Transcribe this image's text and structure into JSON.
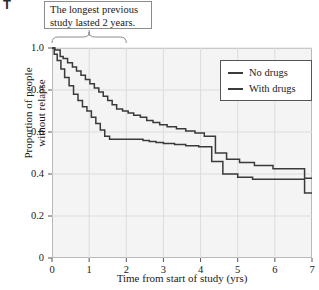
{
  "figure": {
    "corner_mark": "T",
    "annotation": {
      "name": "callout-longest-previous-study",
      "lines": [
        "The longest previous",
        "study lasted 2 years."
      ],
      "brace_span_x": [
        0,
        2
      ]
    },
    "colors": {
      "plot_background": "#f4f4f4",
      "grid": "#dcdcdc",
      "axis": "#555555",
      "series_line": "#3a3a3a",
      "callout_border": "#8c8c8c",
      "legend_border": "#555555",
      "page_background": "#ffffff"
    }
  },
  "chart_data": {
    "type": "line",
    "title": "",
    "subtitle": "",
    "xlabel": "Time from start of study (yrs)",
    "ylabel": "Proportion of people without relapse",
    "ylabel_lines": [
      "Proportion of people",
      "without relapse"
    ],
    "xlim": [
      0,
      7
    ],
    "ylim": [
      0,
      1.0
    ],
    "xticks": [
      0,
      1,
      2,
      3,
      4,
      5,
      6,
      7
    ],
    "xticklabels": [
      "0",
      "1",
      "2",
      "3",
      "4",
      "5",
      "6",
      "7"
    ],
    "yticks": [
      0,
      0.2,
      0.4,
      0.6,
      0.8,
      1.0
    ],
    "yticklabels": [
      "0",
      "0.2",
      "0.4",
      "0.6",
      "0.8",
      "1.0"
    ],
    "grid": true,
    "legend_position": "top-right",
    "step_type": "post",
    "legend": [
      "No drugs",
      "With drugs"
    ],
    "annotations": [
      {
        "text": "The longest previous study lasted 2 years.",
        "type": "brace-callout",
        "x_range": [
          0,
          2
        ]
      }
    ],
    "series": [
      {
        "name": "No drugs",
        "x": [
          0.0,
          0.08,
          0.22,
          0.3,
          0.42,
          0.55,
          0.66,
          0.78,
          0.9,
          1.02,
          1.14,
          1.26,
          1.38,
          1.5,
          1.62,
          1.74,
          1.9,
          2.05,
          2.2,
          2.38,
          2.55,
          2.72,
          2.9,
          3.1,
          3.35,
          3.6,
          3.85,
          4.1,
          4.4,
          4.7,
          5.05,
          5.45,
          5.95,
          6.8
        ],
        "y": [
          1.0,
          0.99,
          0.96,
          0.95,
          0.93,
          0.91,
          0.89,
          0.87,
          0.85,
          0.83,
          0.81,
          0.79,
          0.77,
          0.75,
          0.73,
          0.71,
          0.7,
          0.69,
          0.68,
          0.67,
          0.655,
          0.645,
          0.635,
          0.625,
          0.615,
          0.605,
          0.595,
          0.58,
          0.5,
          0.47,
          0.455,
          0.44,
          0.425,
          0.38
        ]
      },
      {
        "name": "With drugs",
        "x": [
          0.0,
          0.06,
          0.14,
          0.24,
          0.34,
          0.46,
          0.58,
          0.7,
          0.82,
          0.94,
          1.06,
          1.18,
          1.3,
          1.42,
          1.55,
          2.3,
          2.45,
          2.62,
          2.8,
          3.0,
          3.3,
          3.6,
          3.95,
          4.3,
          4.6,
          5.0,
          5.4,
          6.8
        ],
        "y": [
          1.0,
          0.97,
          0.94,
          0.9,
          0.86,
          0.82,
          0.78,
          0.75,
          0.72,
          0.7,
          0.67,
          0.64,
          0.61,
          0.58,
          0.565,
          0.565,
          0.56,
          0.555,
          0.55,
          0.545,
          0.54,
          0.535,
          0.53,
          0.46,
          0.4,
          0.385,
          0.375,
          0.31
        ]
      }
    ]
  }
}
